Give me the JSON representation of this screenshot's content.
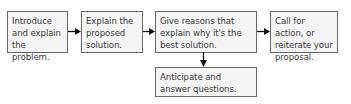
{
  "diagram": {
    "type": "flowchart",
    "steps": [
      {
        "id": "step1",
        "label": "Introduce and explain the problem."
      },
      {
        "id": "step2",
        "label": "Explain the proposed solution."
      },
      {
        "id": "step3",
        "label": "Give reasons that explain why it's the best solution."
      },
      {
        "id": "step4",
        "label": "Call for action, or reiterate your proposal."
      },
      {
        "id": "step5",
        "label": "Anticipate and answer questions."
      }
    ],
    "edges": [
      {
        "from": "step1",
        "to": "step2"
      },
      {
        "from": "step2",
        "to": "step3"
      },
      {
        "from": "step3",
        "to": "step4"
      },
      {
        "from": "step3",
        "to": "step5"
      }
    ],
    "colors": {
      "border": "#6a6a6a",
      "fill": "#f4f4f4",
      "text": "#3a3a3a",
      "arrow": "#111111"
    }
  }
}
